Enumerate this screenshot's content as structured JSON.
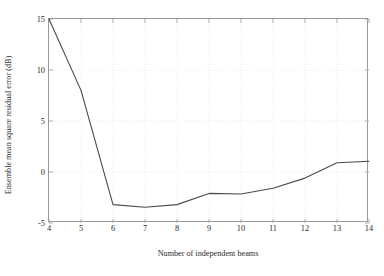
{
  "chart_data": {
    "type": "line",
    "title": "",
    "xlabel": "Number of independent beams",
    "ylabel": "Ensemble mean square residual error (dB)",
    "xlim": [
      4,
      14
    ],
    "ylim": [
      -5,
      15
    ],
    "xticks": [
      4,
      5,
      6,
      7,
      8,
      9,
      10,
      11,
      12,
      13,
      14
    ],
    "xticklabels": [
      "4",
      "5",
      "6",
      "7",
      "8",
      "9",
      "10",
      "11",
      "12",
      "13",
      "14"
    ],
    "yticks": [
      -5,
      0,
      5,
      10,
      15
    ],
    "yticklabels": [
      "-5",
      "0",
      "5",
      "10",
      "15"
    ],
    "grid": "dotted-minor-both-axes",
    "legend": "none",
    "box": true,
    "line_color": "#4a4a4a",
    "axis_color": "#9a9a9a",
    "grid_color": "#e3e3e3",
    "background": "#ffffff",
    "x": [
      4,
      5,
      6,
      7,
      8,
      9,
      10,
      11,
      12,
      13,
      14
    ],
    "values": [
      15.0,
      8.0,
      -3.2,
      -3.45,
      -3.2,
      -2.1,
      -2.15,
      -1.6,
      -0.6,
      0.9,
      1.05
    ],
    "series": [
      {
        "name": "ensemble mean square residual error",
        "values": [
          15.0,
          8.0,
          -3.2,
          -3.45,
          -3.2,
          -2.1,
          -2.15,
          -1.6,
          -0.6,
          0.9,
          1.05
        ]
      }
    ]
  }
}
